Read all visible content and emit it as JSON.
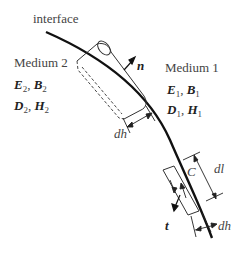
{
  "labels": {
    "interface": "interface",
    "medium2": "Medium 2",
    "medium1": "Medium 1",
    "normal": "n",
    "tangent": "t",
    "dh_top": "dh",
    "dh_bottom": "dh",
    "dl": "dl",
    "contour": "C"
  },
  "medium2_fields": {
    "line1": {
      "a": "E",
      "a_sub": "2",
      "b": "B",
      "b_sub": "2"
    },
    "line2": {
      "a": "D",
      "a_sub": "2",
      "b": "H",
      "b_sub": "2"
    }
  },
  "medium1_fields": {
    "line1": {
      "a": "E",
      "a_sub": "1",
      "b": "B",
      "b_sub": "1"
    },
    "line2": {
      "a": "D",
      "a_sub": "1",
      "b": "H",
      "b_sub": "1"
    }
  },
  "colors": {
    "stroke": "#222222",
    "text": "#444444"
  }
}
